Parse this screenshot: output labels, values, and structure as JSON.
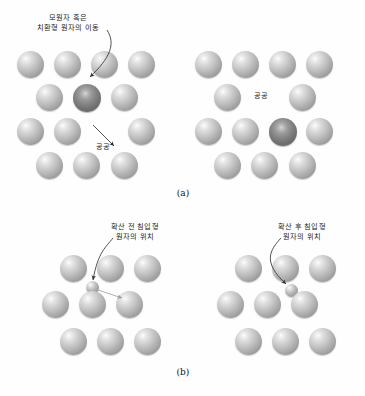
{
  "figure": {
    "background_color": "#fefefe",
    "atom_color_normal": "#aaaaaa",
    "atom_color_dark": "#717171",
    "atom_color_small": "#b6b6b6",
    "arrow_color": "#3a3a3a"
  },
  "panels": [
    {
      "id": "a",
      "caption": "(a)",
      "labels": {
        "moving_atom_line1": "모원자 혹은",
        "moving_atom_line2": "치환형 원자의 이동",
        "vacancy_left": "공공",
        "vacancy_right": "공공"
      }
    },
    {
      "id": "b",
      "caption": "(b)",
      "labels": {
        "before_line1": "확산 전 침입형",
        "before_line2": "원자의 위치",
        "after_line1": "확산 후 침입형",
        "after_line2": "원자의 위치"
      }
    }
  ],
  "icons": {
    "arrow": "curved-arrow-icon",
    "atom": "sphere-atom-icon",
    "vacancy": "vacancy-site-icon"
  }
}
